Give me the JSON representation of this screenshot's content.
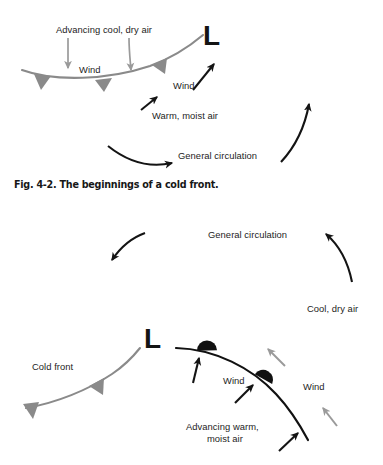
{
  "figure": {
    "caption": "Fig. 4-2. The beginnings of a cold front.",
    "colors": {
      "cold_front": "#8a8a8a",
      "warm_front": "#111111",
      "gray_arrow": "#9a9a9a",
      "black_arrow": "#141414",
      "text": "#1d1d1d",
      "background": "#ffffff"
    }
  },
  "panel_top": {
    "low_pressure_symbol": "L",
    "labels": {
      "advancing_cool_dry_air": "Advancing cool, dry air",
      "wind_left": "Wind",
      "wind_right": "Wind",
      "warm_moist_air": "Warm, moist air",
      "general_circulation": "General circulation"
    }
  },
  "panel_bottom": {
    "low_pressure_symbol": "L",
    "labels": {
      "general_circulation": "General circulation",
      "cool_dry_air": "Cool, dry air",
      "cold_front": "Cold front",
      "wind_right": "Wind",
      "wind_middle": "Wind",
      "advancing_warm_line1": "Advancing warm,",
      "advancing_warm_line2": "moist air"
    }
  }
}
